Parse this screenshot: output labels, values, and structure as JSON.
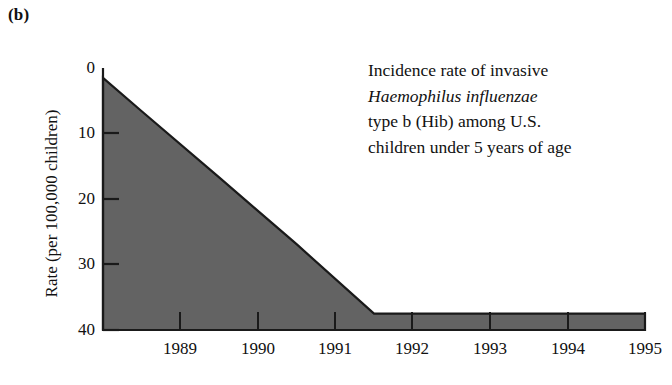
{
  "panel": {
    "label": "(b)"
  },
  "annotation": {
    "lines": [
      {
        "text": "Incidence rate of invasive",
        "italic": false
      },
      {
        "text": "Haemophilus influenzae",
        "italic": true
      },
      {
        "text": "type b (Hib) among U.S.",
        "italic": false
      },
      {
        "text": "children under 5 years of age",
        "italic": false
      }
    ]
  },
  "chart_data": {
    "type": "area",
    "title": "",
    "subtitle": "",
    "xlabel": "",
    "ylabel": "Rate (per 100,000 children)",
    "ylim": [
      0,
      40
    ],
    "yticks": [
      0,
      10,
      20,
      30,
      40
    ],
    "ytick_labels": [
      "0",
      "10",
      "20",
      "30",
      "40"
    ],
    "xticks": [
      1989,
      1990,
      1991,
      1992,
      1993,
      1994,
      1995
    ],
    "xtick_labels": [
      "1989",
      "1990",
      "1991",
      "1992",
      "1993",
      "1994",
      "1995"
    ],
    "xlim": [
      1988.5,
      1995.5
    ],
    "grid": false,
    "legend": null,
    "series": [
      {
        "name": "Hib incidence rate",
        "x": [
          1988.5,
          1989,
          1990,
          1991,
          1992,
          1993,
          1994,
          1995,
          1995.5
        ],
        "values": [
          38.5,
          33.4,
          23.3,
          13.1,
          2.5,
          2.5,
          2.5,
          2.5,
          2.5
        ],
        "fill_color": "#636363",
        "line_color": "#1a1a1a"
      }
    ]
  },
  "axes": {
    "y_tick_positions_px": [
      68,
      133,
      199,
      264,
      330
    ],
    "x_tick_positions_px": [
      180,
      258,
      335,
      412,
      490,
      568,
      645
    ],
    "plot_left_px": 103,
    "plot_right_px": 645,
    "plot_top_px": 68,
    "plot_bottom_px": 330,
    "axis_color": "#1a1a1a"
  },
  "colors": {
    "area_fill": "#636363",
    "area_outline": "#1a1a1a",
    "text": "#111111",
    "background": "#ffffff"
  }
}
